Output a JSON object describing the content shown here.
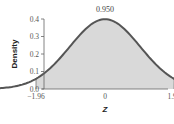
{
  "chart_data": {
    "type": "area",
    "title": "",
    "xlabel": "Z",
    "ylabel": "Density",
    "annotation": "0.950",
    "distribution": "standard normal",
    "shaded_interval": [
      -1.96,
      1.96
    ],
    "shaded_probability": 0.95,
    "x_ticks": [
      "-1.96",
      "0",
      "1.96"
    ],
    "x_tick_values": [
      -1.96,
      0,
      1.96
    ],
    "y_ticks": [
      "0.0",
      "0.1",
      "0.2",
      "0.3",
      "0.4"
    ],
    "y_tick_values": [
      0.0,
      0.1,
      0.2,
      0.3,
      0.4
    ],
    "xlim": [
      -3.5,
      3.5
    ],
    "ylim": [
      0,
      0.4
    ],
    "x": [
      -3.5,
      -3.0,
      -2.5,
      -2.0,
      -1.96,
      -1.5,
      -1.0,
      -0.5,
      0.0,
      0.5,
      1.0,
      1.5,
      1.96,
      2.0,
      2.5,
      3.0,
      3.5
    ],
    "values": [
      0.0009,
      0.0044,
      0.0175,
      0.054,
      0.0584,
      0.1295,
      0.242,
      0.3521,
      0.3989,
      0.3521,
      0.242,
      0.1295,
      0.0584,
      0.054,
      0.0175,
      0.0044,
      0.0009
    ],
    "grid": false,
    "legend": null,
    "colors": {
      "curve": "#555555",
      "fill": "#d9d9d9",
      "axis": "#666666"
    }
  },
  "labels": {
    "annotation": "0.950",
    "xlabel": "Z",
    "ylabel": "Density",
    "y_ticks": [
      "0.0",
      "0.1",
      "0.2",
      "0.3",
      "0.4"
    ],
    "x_ticks": [
      "−1.96",
      "0",
      "1.96"
    ]
  }
}
